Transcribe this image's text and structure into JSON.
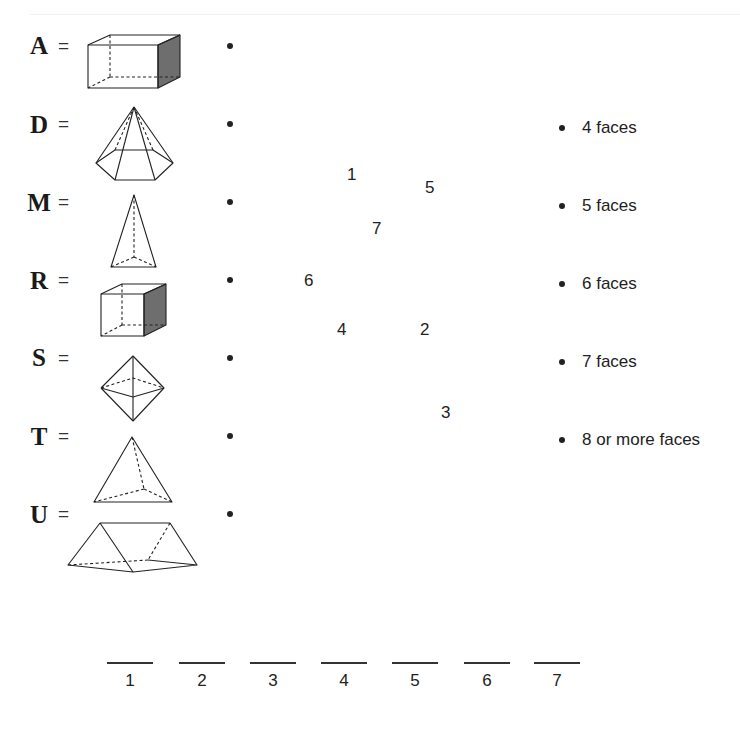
{
  "shapes": [
    {
      "letter": "A",
      "equals": "=",
      "solid": "rectangular-prism"
    },
    {
      "letter": "D",
      "equals": "=",
      "solid": "hexagonal-pyramid"
    },
    {
      "letter": "M",
      "equals": "=",
      "solid": "triangular-pyramid-tall"
    },
    {
      "letter": "R",
      "equals": "=",
      "solid": "cube"
    },
    {
      "letter": "S",
      "equals": "=",
      "solid": "octahedron"
    },
    {
      "letter": "T",
      "equals": "=",
      "solid": "tetrahedron"
    },
    {
      "letter": "U",
      "equals": "=",
      "solid": "triangular-prism"
    }
  ],
  "scrambled_numbers": [
    {
      "value": "1",
      "x": 347,
      "y": 165
    },
    {
      "value": "5",
      "x": 425,
      "y": 178
    },
    {
      "value": "7",
      "x": 372,
      "y": 219
    },
    {
      "value": "6",
      "x": 304,
      "y": 271
    },
    {
      "value": "4",
      "x": 337,
      "y": 320
    },
    {
      "value": "2",
      "x": 420,
      "y": 320
    },
    {
      "value": "3",
      "x": 441,
      "y": 403
    }
  ],
  "face_options": [
    {
      "label": "4 faces"
    },
    {
      "label": "5 faces"
    },
    {
      "label": "6 faces"
    },
    {
      "label": "7 faces"
    },
    {
      "label": "8 or more faces"
    }
  ],
  "answer_blanks": [
    {
      "number": "1",
      "value": ""
    },
    {
      "number": "2",
      "value": ""
    },
    {
      "number": "3",
      "value": ""
    },
    {
      "number": "4",
      "value": ""
    },
    {
      "number": "5",
      "value": ""
    },
    {
      "number": "6",
      "value": ""
    },
    {
      "number": "7",
      "value": ""
    }
  ],
  "colors": {
    "line": "#222222",
    "shaded_face": "#6e6e6e",
    "text": "#222222"
  }
}
